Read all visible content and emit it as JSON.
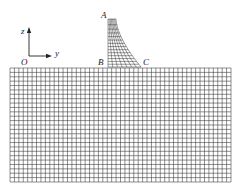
{
  "figure": {
    "labels": {
      "A": "A",
      "B": "B",
      "C": "C",
      "O": "O",
      "z": "z",
      "y": "y"
    },
    "colors": {
      "mesh": "#333333",
      "background": "#ffffff",
      "text": "#222222"
    },
    "foundation": {
      "x0": 10,
      "x1": 231,
      "y0": 68,
      "y1": 182,
      "columns": 50,
      "rows": 26
    },
    "dam": {
      "top_left": [
        108,
        19
      ],
      "top_right": [
        116,
        19
      ],
      "base_left": [
        108,
        67
      ],
      "base_right": [
        141,
        67
      ],
      "columns": 7,
      "rows": 14
    },
    "axes": {
      "origin": [
        29,
        56
      ],
      "z_end": [
        29,
        27
      ],
      "y_end": [
        52,
        56
      ]
    }
  }
}
